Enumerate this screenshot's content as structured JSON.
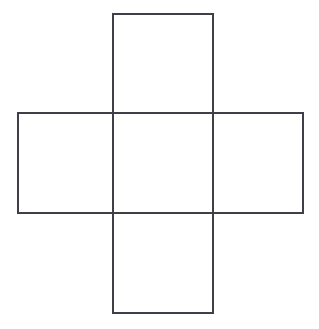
{
  "figure": {
    "name": "cross-net",
    "background_color": "#ffffff",
    "stroke_color": "#3f3f47",
    "fill_color": "#ffffff",
    "stroke_width": 2,
    "canvas": {
      "width": 319,
      "height": 329
    },
    "grid": {
      "cell_width": 100,
      "cell_height": 100,
      "columns_x": [
        18,
        113,
        213,
        303
      ],
      "rows_y": [
        14,
        113,
        213,
        313
      ]
    },
    "cells": [
      {
        "id": "top-cell",
        "label": "top",
        "x": 113,
        "y": 14,
        "width": 100,
        "height": 99
      },
      {
        "id": "left-cell",
        "label": "left",
        "x": 18,
        "y": 113,
        "width": 95,
        "height": 100
      },
      {
        "id": "center-cell",
        "label": "center",
        "x": 113,
        "y": 113,
        "width": 100,
        "height": 100
      },
      {
        "id": "right-cell",
        "label": "right",
        "x": 213,
        "y": 113,
        "width": 90,
        "height": 100
      },
      {
        "id": "bottom-cell",
        "label": "bottom",
        "x": 113,
        "y": 213,
        "width": 100,
        "height": 100
      }
    ],
    "outline_path": "M113,14 L213,14 L213,113 L303,113 L303,213 L213,213 L213,313 L113,313 L113,213 L18,213 L18,113 L113,113 Z",
    "interior_segments": [
      {
        "id": "segment-top-center",
        "x1": 113,
        "y1": 113,
        "x2": 213,
        "y2": 113
      },
      {
        "id": "segment-center-bottom",
        "x1": 113,
        "y1": 213,
        "x2": 213,
        "y2": 213
      },
      {
        "id": "segment-left-center",
        "x1": 113,
        "y1": 113,
        "x2": 113,
        "y2": 213
      },
      {
        "id": "segment-center-right",
        "x1": 213,
        "y1": 113,
        "x2": 213,
        "y2": 213
      }
    ]
  }
}
